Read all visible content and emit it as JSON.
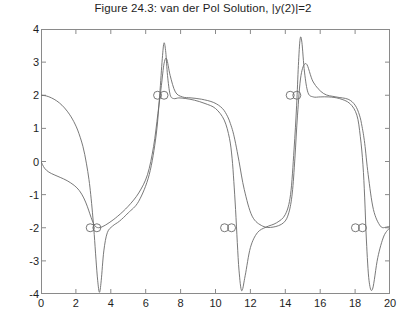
{
  "chart_data": {
    "type": "line",
    "title": "Figure 24.3: van der Pol Solution, |y(2)|=2",
    "xlabel": "",
    "ylabel": "",
    "xlim": [
      0,
      20
    ],
    "ylim": [
      -4,
      4
    ],
    "xticks": [
      0,
      2,
      4,
      6,
      8,
      10,
      12,
      14,
      16,
      18,
      20
    ],
    "yticks": [
      -4,
      -3,
      -2,
      -1,
      0,
      1,
      2,
      3,
      4
    ],
    "grid": false,
    "legend": null,
    "line_color": "#6a6a6a",
    "marker_color": "#6a6a6a",
    "marker_shape": "circle-open",
    "series": [
      {
        "name": "y1",
        "x": [
          0.0,
          0.3,
          0.6,
          0.9,
          1.2,
          1.5,
          1.8,
          2.1,
          2.4,
          2.6,
          2.75,
          2.85,
          2.95,
          3.05,
          3.15,
          3.25,
          3.35,
          3.45,
          3.6,
          3.8,
          4.1,
          4.5,
          5.0,
          5.6,
          6.2,
          6.6,
          6.8,
          6.95,
          7.05,
          7.15,
          7.25,
          7.4,
          7.6,
          7.9,
          8.3,
          8.8,
          9.4,
          10.0,
          10.5,
          10.8,
          10.95,
          11.05,
          11.15,
          11.25,
          11.35,
          11.5,
          11.7,
          12.0,
          12.4,
          12.9,
          13.5,
          14.0,
          14.3,
          14.5,
          14.65,
          14.75,
          14.85,
          14.95,
          15.1,
          15.3,
          15.6,
          16.0,
          16.5,
          17.1,
          17.7,
          18.1,
          18.3,
          18.45,
          18.55,
          18.65,
          18.8,
          19.0,
          19.3,
          19.65,
          20.0
        ],
        "y": [
          2.0,
          1.98,
          1.92,
          1.83,
          1.7,
          1.52,
          1.28,
          0.95,
          0.46,
          -0.05,
          -0.55,
          -1.0,
          -1.55,
          -2.2,
          -2.95,
          -3.6,
          -3.95,
          -3.6,
          -2.7,
          -2.15,
          -1.95,
          -1.8,
          -1.55,
          -1.2,
          -0.4,
          0.8,
          2.0,
          3.1,
          3.58,
          3.3,
          2.6,
          2.02,
          1.9,
          1.92,
          1.9,
          1.85,
          1.75,
          1.6,
          1.25,
          0.7,
          0.1,
          -0.6,
          -1.45,
          -2.45,
          -3.3,
          -3.9,
          -3.45,
          -2.6,
          -2.15,
          -1.98,
          -1.85,
          -1.6,
          -1.0,
          0.35,
          1.7,
          2.9,
          3.7,
          3.6,
          2.7,
          2.08,
          1.95,
          1.95,
          1.95,
          1.9,
          1.75,
          1.4,
          0.75,
          -0.1,
          -1.1,
          -2.4,
          -3.6,
          -3.85,
          -2.9,
          -2.25,
          -2.0
        ]
      },
      {
        "name": "y2",
        "x": [
          0.0,
          0.2,
          0.45,
          0.75,
          1.1,
          1.5,
          1.9,
          2.2,
          2.45,
          2.65,
          2.8,
          2.95,
          3.1,
          3.3,
          3.55,
          3.9,
          4.4,
          5.0,
          5.6,
          6.1,
          6.45,
          6.7,
          6.9,
          7.05,
          7.2,
          7.4,
          7.7,
          8.1,
          8.6,
          9.2,
          9.9,
          10.4,
          10.7,
          10.85,
          11.0,
          11.15,
          11.35,
          11.65,
          12.1,
          12.7,
          13.3,
          13.9,
          14.2,
          14.4,
          14.55,
          14.7,
          14.9,
          15.2,
          15.6,
          16.2,
          16.9,
          17.6,
          18.0,
          18.25,
          18.4,
          18.55,
          18.75,
          19.05,
          19.45,
          19.8,
          20.0
        ],
        "y": [
          0.0,
          -0.2,
          -0.32,
          -0.4,
          -0.48,
          -0.58,
          -0.72,
          -0.88,
          -1.1,
          -1.35,
          -1.58,
          -1.8,
          -1.95,
          -2.0,
          -1.96,
          -1.85,
          -1.65,
          -1.35,
          -0.95,
          -0.4,
          0.45,
          1.45,
          2.3,
          2.95,
          3.1,
          2.6,
          2.1,
          1.95,
          1.92,
          1.88,
          1.78,
          1.6,
          1.35,
          1.15,
          0.9,
          0.55,
          0.0,
          -0.85,
          -1.65,
          -1.95,
          -1.98,
          -1.85,
          -1.55,
          -0.95,
          0.1,
          1.4,
          2.6,
          2.95,
          2.4,
          2.05,
          1.95,
          1.88,
          1.7,
          1.4,
          1.05,
          0.55,
          -0.4,
          -1.45,
          -1.95,
          -1.98,
          -1.95
        ]
      }
    ],
    "markers": [
      {
        "x": 2.82,
        "y": -2.0
      },
      {
        "x": 3.2,
        "y": -2.0
      },
      {
        "x": 6.68,
        "y": 2.0
      },
      {
        "x": 7.05,
        "y": 2.0
      },
      {
        "x": 10.52,
        "y": -2.0
      },
      {
        "x": 10.92,
        "y": -2.0
      },
      {
        "x": 14.28,
        "y": 2.0
      },
      {
        "x": 14.66,
        "y": 2.0
      },
      {
        "x": 18.02,
        "y": -2.0
      },
      {
        "x": 18.42,
        "y": -2.0
      }
    ]
  },
  "axes": {
    "ytick_labels": [
      "4",
      "3",
      "2",
      "1",
      "0",
      "-1",
      "-2",
      "-3",
      "-4"
    ],
    "xtick_labels": [
      "0",
      "2",
      "4",
      "6",
      "8",
      "10",
      "12",
      "14",
      "16",
      "18",
      "20"
    ]
  }
}
